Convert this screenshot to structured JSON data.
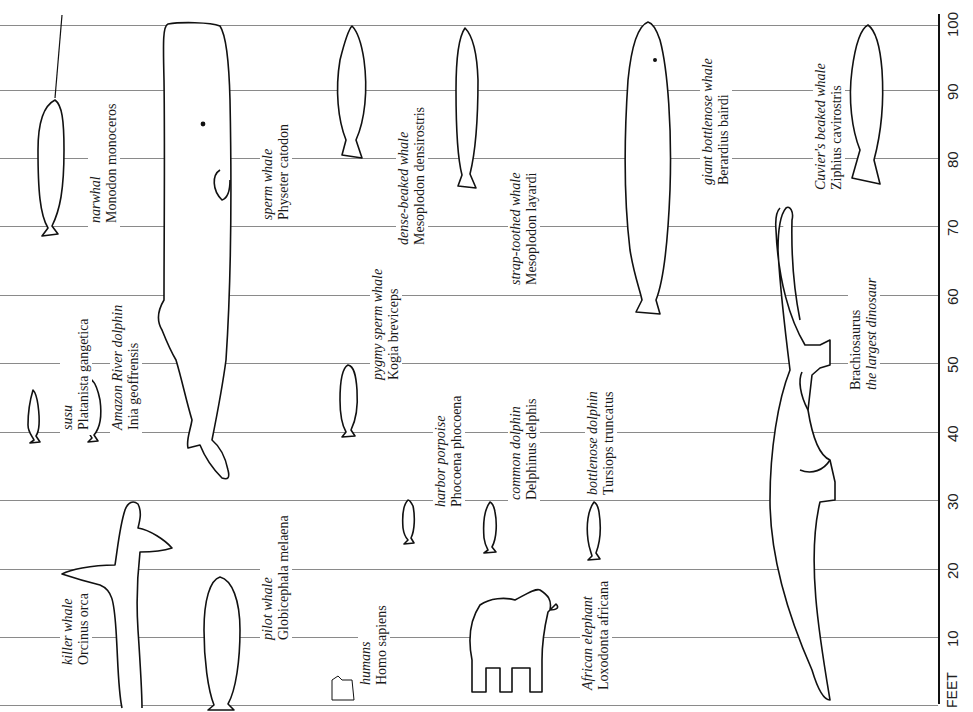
{
  "chart": {
    "axis_unit": "FEET",
    "ticks": [
      {
        "value": "100",
        "y": 25
      },
      {
        "value": "90",
        "y": 90
      },
      {
        "value": "80",
        "y": 158
      },
      {
        "value": "70",
        "y": 226
      },
      {
        "value": "60",
        "y": 295
      },
      {
        "value": "50",
        "y": 363
      },
      {
        "value": "40",
        "y": 432
      },
      {
        "value": "30",
        "y": 500
      },
      {
        "value": "20",
        "y": 569
      },
      {
        "value": "10",
        "y": 637
      }
    ]
  },
  "animals": [
    {
      "common": "killer whale",
      "scientific": "Orcinus orca",
      "approx_length_ft": 30
    },
    {
      "common": "narwhal",
      "scientific": "Monodon monoceros",
      "approx_length_ft": 30
    },
    {
      "common": "susu",
      "scientific": "Platanista gangetica",
      "approx_length_ft": 8
    },
    {
      "common": "Amazon River dolphin",
      "scientific": "Inia geoffrensis",
      "approx_length_ft": 9
    },
    {
      "common": "pilot whale",
      "scientific": "Globicephala melaena",
      "approx_length_ft": 20
    },
    {
      "common": "sperm whale",
      "scientific": "Physeter catodon",
      "approx_length_ft": 70
    },
    {
      "common": "humans",
      "scientific": "Homo sapiens",
      "approx_length_ft": 6
    },
    {
      "common": "pygmy sperm whale",
      "scientific": "Kogia breviceps",
      "approx_length_ft": 11
    },
    {
      "common": "dense-beaked whale",
      "scientific": "Mesoplodon densirostris",
      "approx_length_ft": 17
    },
    {
      "common": "harbor porpoise",
      "scientific": "Phocoena phocoena",
      "approx_length_ft": 5
    },
    {
      "common": "common dolphin",
      "scientific": "Delphinus delphis",
      "approx_length_ft": 8
    },
    {
      "common": "strap-toothed whale",
      "scientific": "Mesoplodon layardi",
      "approx_length_ft": 20
    },
    {
      "common": "bottlenose dolphin",
      "scientific": "Tursiops truncatus",
      "approx_length_ft": 12
    },
    {
      "common": "African elephant",
      "scientific": "Loxodonta africana",
      "approx_length_ft": 13
    },
    {
      "common": "giant bottlenose whale",
      "scientific": "Berardius bairdi",
      "approx_length_ft": 40
    },
    {
      "common": "Brachiosaurus",
      "scientific": "the largest dinosaur",
      "approx_length_ft": 75
    },
    {
      "common": "Cuvier's beaked whale",
      "scientific": "Ziphius cavirostris",
      "approx_length_ft": 26
    }
  ]
}
